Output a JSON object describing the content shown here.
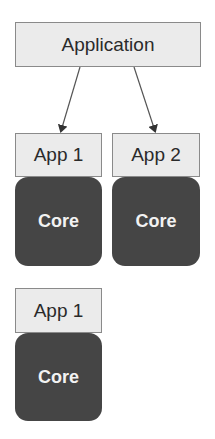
{
  "diagram": {
    "application": {
      "label": "Application"
    },
    "group_top": [
      {
        "app_label": "App 1",
        "core_label": "Core"
      },
      {
        "app_label": "App 2",
        "core_label": "Core"
      }
    ],
    "group_bottom": [
      {
        "app_label": "App 1",
        "core_label": "Core"
      }
    ],
    "edges": [
      {
        "from": "Application",
        "to": "App 1"
      },
      {
        "from": "Application",
        "to": "App 2"
      }
    ],
    "colors": {
      "app_fill": "#ebebeb",
      "app_border": "#8a8a8a",
      "core_fill": "#454545",
      "core_text": "#f2f2f2",
      "arrow": "#444444"
    }
  }
}
